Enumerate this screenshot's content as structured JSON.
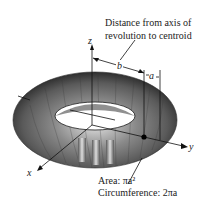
{
  "diagram": {
    "callout_top": {
      "line1": "Distance from axis of",
      "line2": "revolution to centroid"
    },
    "axes": {
      "x": "x",
      "y": "y",
      "z": "z"
    },
    "dimensions": {
      "b": "b",
      "a": "a"
    },
    "callout_bottom": {
      "area": "Area: πa²",
      "circumference": "Circumference: 2πa"
    },
    "colors": {
      "torus_dark": "#3a3a3a",
      "torus_mid": "#7a7a7a",
      "torus_light": "#cfcfcf",
      "line": "#111111",
      "background": "#ffffff"
    }
  }
}
